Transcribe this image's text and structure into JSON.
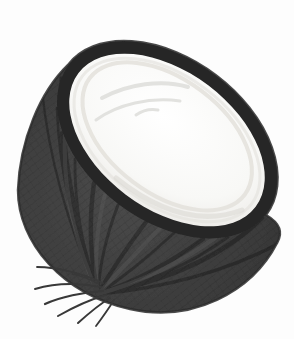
{
  "image": {
    "subject": "halved coconut",
    "description": "Pencil-style illustration of a coconut cut in half, tilted so the white cut face of flesh shows at the upper right inside a dark charcoal fibrous husk; ridge lines fan across the husk and a small tuft of root-like fibers sticks out at the lower left.",
    "background": "#fdfdfd"
  },
  "colors": {
    "background": "#fdfdfd",
    "husk_center": "#4a4a4a",
    "husk_mid": "#3a3a3a",
    "husk_edge": "#2e2e2e",
    "outline": "#2b2b2b",
    "rim": "#262626",
    "texture_line": "#1d1d1d",
    "husk_highlight": "#6a6a6a",
    "fiber": "#383838",
    "flesh_center": "#ffffff",
    "flesh_mid": "#f8f8f6",
    "flesh_edge": "#ebe9e5",
    "flesh_ring": "#e4e2dd",
    "flesh_sketch": "#e2e2df",
    "flesh_shadow": "#d9d7d1"
  }
}
